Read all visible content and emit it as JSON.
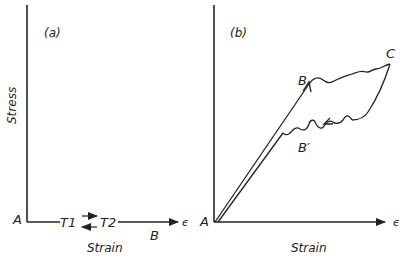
{
  "panels": [
    {
      "id": "a",
      "label": "(a)",
      "ylabel": "Stress",
      "xlabel": "Strain",
      "origin_label": "A",
      "x_symbol": "ϵ",
      "points": {
        "T1": "T1",
        "T2": "T2",
        "B": "B"
      }
    },
    {
      "id": "b",
      "label": "(b)",
      "xlabel": "Strain",
      "origin_label": "A",
      "x_symbol": "ϵ",
      "points": {
        "B": "B",
        "C": "C",
        "Bprime": "B′"
      }
    }
  ]
}
